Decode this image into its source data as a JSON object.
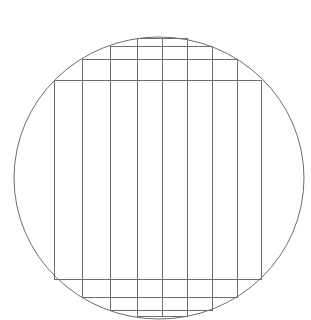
{
  "diagram": {
    "stroke_color": "#6e6e6e",
    "background": "#ffffff",
    "circle": {
      "cx": 159,
      "cy": 178,
      "rx": 145,
      "ry": 141
    },
    "outer_rect": {
      "x1": 54,
      "y1": 80,
      "x2": 261,
      "y2": 279
    },
    "column_dividers_x": [
      82,
      110,
      137,
      162,
      187,
      212,
      237
    ],
    "stepped_rects": [
      {
        "x1": 82,
        "y1": 59,
        "x2": 237,
        "y2": 297
      },
      {
        "x1": 110,
        "y1": 46,
        "x2": 212,
        "y2": 310
      },
      {
        "x1": 137,
        "y1": 38,
        "x2": 187,
        "y2": 316
      }
    ],
    "center_line_x": 162
  }
}
